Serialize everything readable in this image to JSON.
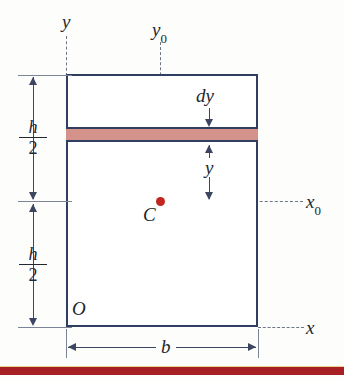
{
  "figure": {
    "type": "engineering-cross-section-diagram",
    "colors": {
      "outline": "#2f3e61",
      "strip_fill": "#d4938a",
      "centroid_dot": "#c0261f",
      "dimension_line": "#3c4660",
      "dashed_axis": "#6d7588",
      "bottom_band": "#a51f23",
      "background": "#fdfdfc"
    }
  },
  "labels": {
    "axis_y": "y",
    "axis_y0_base": "y",
    "axis_y0_sub": "0",
    "axis_x": "x",
    "axis_x0_base": "x",
    "axis_x0_sub": "0",
    "origin": "O",
    "centroid": "C",
    "strip_thickness": "dy",
    "strip_distance": "y",
    "width": "b",
    "half_height_num": "h",
    "half_height_den": "2"
  },
  "dimensions": {
    "upper_half_height": {
      "symbol_num": "h",
      "symbol_den": "2"
    },
    "lower_half_height": {
      "symbol_num": "h",
      "symbol_den": "2"
    },
    "base_width": {
      "symbol": "b"
    }
  },
  "geometry": {
    "rect": {
      "left": 66,
      "top": 74,
      "width": 192,
      "height": 253
    },
    "strip": {
      "top": 127,
      "height": 15
    },
    "centroid": {
      "x": 160,
      "y": 201
    },
    "y0_axis_x": 160,
    "x0_axis_y": 201
  }
}
